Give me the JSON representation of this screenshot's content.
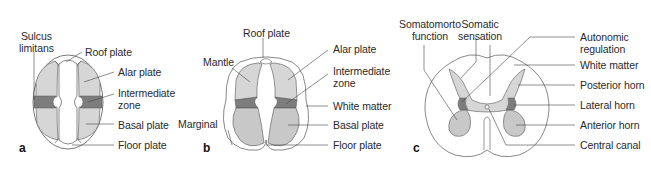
{
  "figure": {
    "colors": {
      "light_gray": "#d6d6d6",
      "mid_gray": "#c4c4c4",
      "dark_gray": "#7d7d7d",
      "outline": "#555555",
      "leader": "#444444"
    },
    "panels": [
      {
        "id": "a",
        "letter": "a",
        "labels": {
          "sulcus_limitans": [
            "Sulcus",
            "limitans"
          ],
          "roof_plate": "Roof plate",
          "alar_plate": "Alar plate",
          "intermediate_zone": [
            "Intermediate",
            "zone"
          ],
          "basal_plate": "Basal plate",
          "floor_plate": "Floor plate"
        }
      },
      {
        "id": "b",
        "letter": "b",
        "labels": {
          "roof_plate": "Roof plate",
          "mantle": "Mantle",
          "marginal": "Marginal",
          "alar_plate": "Alar plate",
          "intermediate_zone": [
            "Intermediate",
            "zone"
          ],
          "white_matter": "White matter",
          "basal_plate": "Basal plate",
          "floor_plate": "Floor plate"
        }
      },
      {
        "id": "c",
        "letter": "c",
        "labels": {
          "somatomotor_function": [
            "Somatomorto",
            "function"
          ],
          "somatic_sensation": [
            "Somatic",
            "sensation"
          ],
          "autonomic_regulation": [
            "Autonomic",
            "regulation"
          ],
          "white_matter": "White matter",
          "posterior_horn": "Posterior horn",
          "lateral_horn": "Lateral horn",
          "anterior_horn": "Anterior horn",
          "central_canal": "Central canal"
        }
      }
    ]
  }
}
